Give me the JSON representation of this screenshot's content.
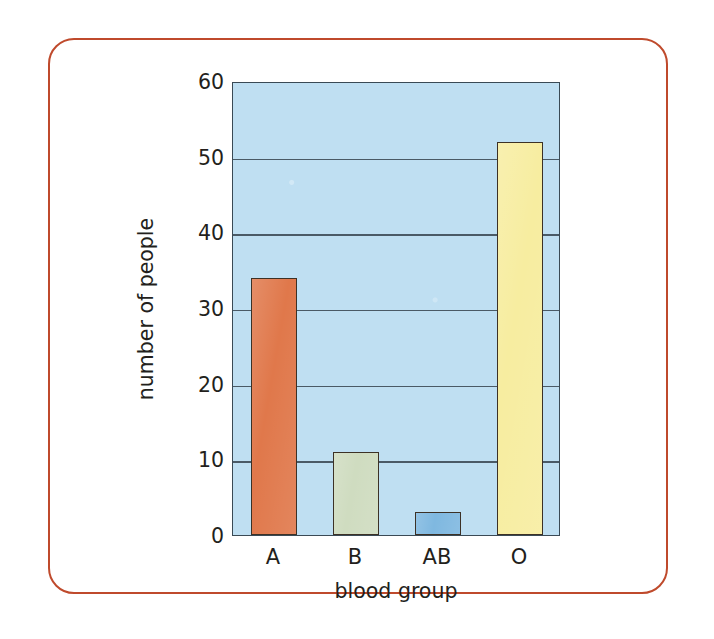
{
  "figure": {
    "frame_color": "#bf4a2c",
    "background_color": "#ffffff"
  },
  "chart_data": {
    "type": "bar",
    "title": "",
    "xlabel": "blood group",
    "ylabel": "number of people",
    "categories": [
      "A",
      "B",
      "AB",
      "O"
    ],
    "values": [
      34,
      11,
      3,
      52
    ],
    "bar_colors": [
      "#e0784b",
      "#cfdcc0",
      "#7fb8e0",
      "#f7eda0"
    ],
    "bar_outline_color": "#3c3126",
    "ylim": [
      0,
      60
    ],
    "yticks": [
      0,
      10,
      20,
      30,
      40,
      50,
      60
    ],
    "ytick_labels": [
      "0",
      "10",
      "20",
      "30",
      "40",
      "50",
      "60"
    ],
    "grid": true,
    "grid_axis": "y",
    "grid_color": "#4a5a66",
    "legend": false,
    "plot_background_color": "#bfdff2",
    "plot_border_color": "#3a4a55"
  }
}
